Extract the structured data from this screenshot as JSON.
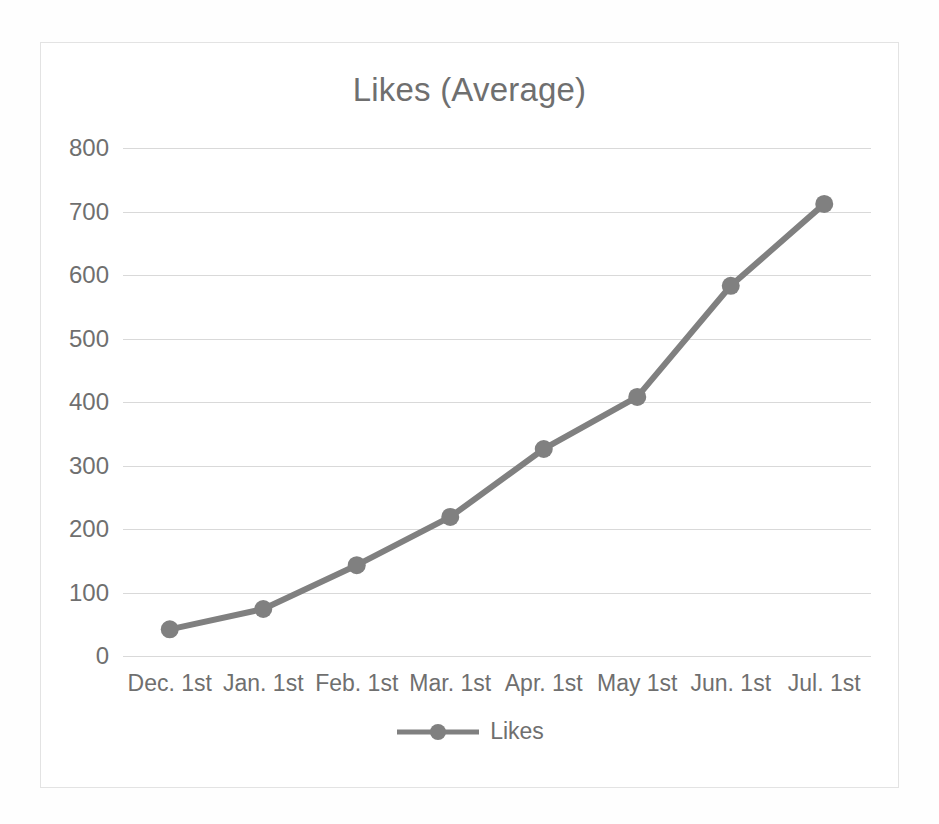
{
  "chart_data": {
    "type": "line",
    "title": "Likes (Average)",
    "xlabel": "",
    "ylabel": "",
    "categories": [
      "Dec. 1st",
      "Jan. 1st",
      "Feb. 1st",
      "Mar. 1st",
      "Apr. 1st",
      "May 1st",
      "Jun. 1st",
      "Jul. 1st"
    ],
    "series": [
      {
        "name": "Likes",
        "values": [
          42,
          74,
          143,
          219,
          326,
          408,
          583,
          712
        ],
        "color": "#808080",
        "marker": "circle"
      }
    ],
    "ylim": [
      0,
      800
    ],
    "ytick_step": 100,
    "yticks": [
      800,
      700,
      600,
      500,
      400,
      300,
      200,
      100,
      0
    ],
    "grid": true,
    "grid_axis": "y",
    "grid_color": "#d9d9d9",
    "legend": true,
    "legend_position": "bottom",
    "legend_entries": [
      "Likes"
    ],
    "frame_border_color": "#e3e3e3",
    "text_color": "#6f6f6f",
    "background": "#ffffff"
  }
}
